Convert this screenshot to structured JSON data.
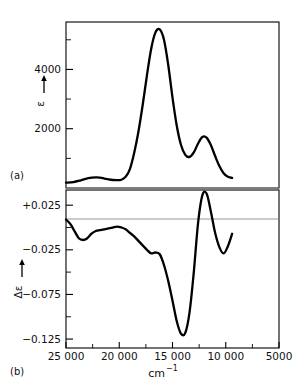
{
  "figure": {
    "panels": [
      {
        "id": "a",
        "label": "(a)",
        "ylabel": "ε",
        "arrow": "↑"
      },
      {
        "id": "b",
        "label": "(b)",
        "ylabel": "Δε",
        "arrow": "↑"
      }
    ],
    "xaxis_title_main": "cm",
    "xaxis_title_sup": "−1",
    "colors": {
      "curve": "#000000",
      "frame": "#000000",
      "zero_line": "#8c8c8c",
      "background": "#ffffff"
    }
  },
  "chart_data": [
    {
      "type": "line",
      "panel": "a",
      "title": "",
      "xlabel": "cm−1",
      "ylabel": "ε",
      "xlim": [
        25000,
        5000
      ],
      "ylim": [
        0,
        5600
      ],
      "xticks": [
        25000,
        20000,
        15000,
        10000,
        5000
      ],
      "xticklabels": [
        "25 000",
        "20 000",
        "15 000",
        "10 000",
        "5000"
      ],
      "yticks": [
        2000,
        4000
      ],
      "yticklabels": [
        "2000",
        "4000"
      ],
      "grid": false,
      "legend": "none",
      "zero_line": 0,
      "x": [
        25000,
        24300,
        23600,
        22900,
        22200,
        21800,
        21400,
        21000,
        20600,
        20200,
        19800,
        19400,
        19000,
        18600,
        18200,
        17800,
        17400,
        17000,
        16600,
        16200,
        15800,
        15400,
        15000,
        14600,
        14200,
        13800,
        13400,
        13000,
        12600,
        12200,
        11800,
        11400,
        11000,
        10600,
        10200,
        9800,
        9400
      ],
      "y": [
        180,
        200,
        260,
        330,
        360,
        350,
        320,
        290,
        270,
        265,
        280,
        380,
        640,
        1180,
        1900,
        2800,
        3800,
        4700,
        5250,
        5350,
        5000,
        4150,
        3050,
        2100,
        1450,
        1120,
        1050,
        1200,
        1500,
        1720,
        1700,
        1450,
        1080,
        740,
        500,
        380,
        340
      ]
    },
    {
      "type": "line",
      "panel": "b",
      "title": "",
      "xlabel": "cm−1",
      "ylabel": "Δε",
      "xlim": [
        25000,
        5000
      ],
      "ylim": [
        -0.135,
        0.042
      ],
      "xticks": [
        25000,
        20000,
        15000,
        10000,
        5000
      ],
      "xticklabels": [
        "25 000",
        "20 000",
        "15 000",
        "10 000",
        "5000"
      ],
      "yticks": [
        0.025,
        -0.025,
        -0.075,
        -0.125
      ],
      "yticklabels": [
        "+0.025",
        "−0.025",
        "−0.075",
        "−0.125"
      ],
      "grid": false,
      "legend": "none",
      "zero_line": 0,
      "x": [
        25000,
        24600,
        24200,
        23800,
        23400,
        23000,
        22600,
        22200,
        21800,
        21400,
        21000,
        20600,
        20200,
        19800,
        19400,
        19000,
        18600,
        18200,
        17800,
        17400,
        17000,
        16600,
        16200,
        15800,
        15400,
        15000,
        14600,
        14200,
        13800,
        13400,
        13000,
        12600,
        12200,
        11800,
        11400,
        11000,
        10600,
        10200,
        9800,
        9400
      ],
      "y": [
        0.009,
        0.004,
        -0.004,
        -0.012,
        -0.014,
        -0.012,
        -0.007,
        -0.004,
        -0.003,
        -0.002,
        -0.001,
        0.0,
        0.001,
        0.0,
        -0.002,
        -0.006,
        -0.01,
        -0.015,
        -0.02,
        -0.025,
        -0.029,
        -0.028,
        -0.03,
        -0.042,
        -0.06,
        -0.082,
        -0.105,
        -0.119,
        -0.118,
        -0.095,
        -0.05,
        0.005,
        0.036,
        0.038,
        0.018,
        -0.006,
        -0.022,
        -0.029,
        -0.021,
        -0.007
      ]
    }
  ]
}
